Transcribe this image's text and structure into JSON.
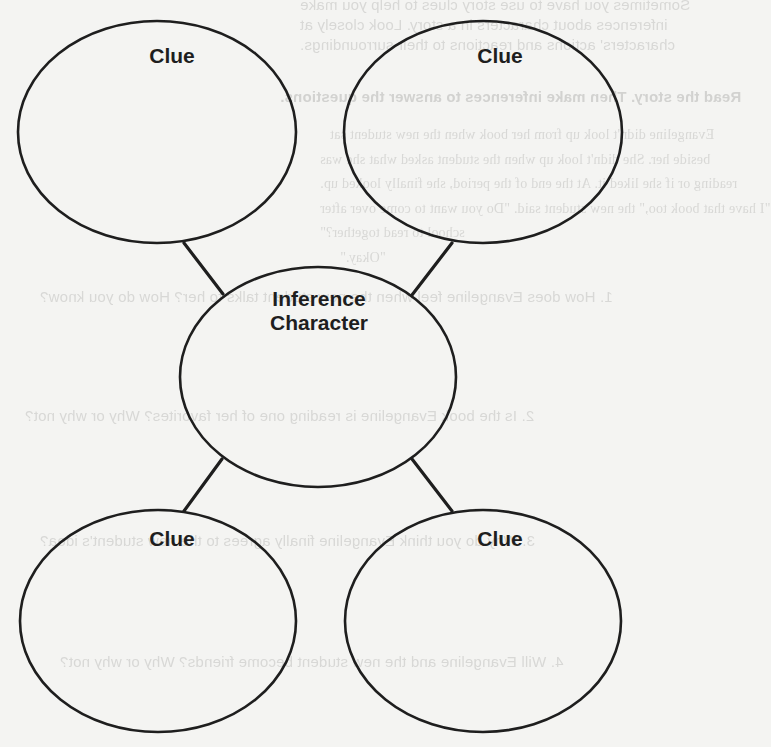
{
  "diagram": {
    "center_node": {
      "label_line1": "Inference",
      "label_line2": "Character",
      "cx": 318,
      "cy": 377,
      "rx": 138,
      "ry": 110
    },
    "clue_nodes": [
      {
        "id": "top-left",
        "label": "Clue",
        "cx": 157,
        "cy": 132,
        "rx": 139,
        "ry": 111
      },
      {
        "id": "top-right",
        "label": "Clue",
        "cx": 483,
        "cy": 132,
        "rx": 139,
        "ry": 111
      },
      {
        "id": "bottom-left",
        "label": "Clue",
        "cx": 158,
        "cy": 621,
        "rx": 138,
        "ry": 111
      },
      {
        "id": "bottom-right",
        "label": "Clue",
        "cx": 483,
        "cy": 621,
        "rx": 138,
        "ry": 111
      }
    ],
    "connectors": [
      {
        "from": "top-left",
        "to": "center",
        "x1": 184,
        "y1": 243,
        "x2": 223,
        "y2": 294
      },
      {
        "from": "top-right",
        "to": "center",
        "x1": 452,
        "y1": 243,
        "x2": 412,
        "y2": 295
      },
      {
        "from": "bottom-left",
        "to": "center",
        "x1": 222,
        "y1": 459,
        "x2": 184,
        "y2": 511
      },
      {
        "from": "bottom-right",
        "to": "center",
        "x1": 412,
        "y1": 459,
        "x2": 452,
        "y2": 511
      }
    ],
    "colors": {
      "stroke": "#1e1e1e",
      "background": "#f4f4f2",
      "bleed_through_text": "#d8d8d6"
    }
  },
  "bleed_through": {
    "note_lines": [
      "Sometimes you have to use story clues to help you make",
      "inferences about characters in a story. Look closely at",
      "characters' actions and reactions to their surroundings."
    ],
    "instruction": "Read the story. Then make inferences to answer the questions.",
    "story_lines": [
      "Evangeline didn't look up from her book when the new student sat",
      "beside her. She didn't look up when the student asked what she was",
      "reading or if she liked it. At the end of the period, she finally looked up.",
      "\"I have that book too,\" the new student said. \"Do you want to come over after",
      "school to read together?\"",
      "\"Okay.\""
    ],
    "questions": [
      "1. How does Evangeline feel when the new student talks to her? How do you know?",
      "2. Is the book Evangeline is reading one of her favorites? Why or why not?",
      "3. Why do you think Evangeline finally agrees to the new student's idea?",
      "4. Will Evangeline and the new student become friends? Why or why not?"
    ]
  }
}
